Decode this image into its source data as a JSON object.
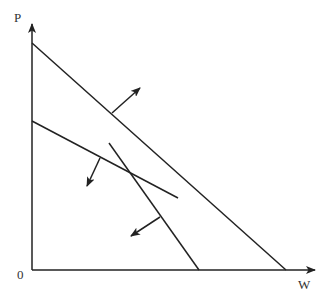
{
  "diagram": {
    "axes": {
      "y_label": "P",
      "x_label": "W",
      "origin_label": "0"
    },
    "lines": [
      {
        "name": "line-1",
        "from": [
          32,
          43
        ],
        "to": [
          286,
          270
        ],
        "arrow_from": [
          112,
          113
        ],
        "arrow_to": [
          140,
          88
        ]
      },
      {
        "name": "line-2",
        "from": [
          32,
          121
        ],
        "to": [
          178,
          198
        ],
        "arrow_from": [
          100,
          158
        ],
        "arrow_to": [
          87,
          186
        ]
      },
      {
        "name": "line-3",
        "from": [
          109,
          143
        ],
        "to": [
          199,
          270
        ],
        "arrow_from": [
          160,
          217
        ],
        "arrow_to": [
          131,
          236
        ]
      }
    ]
  }
}
